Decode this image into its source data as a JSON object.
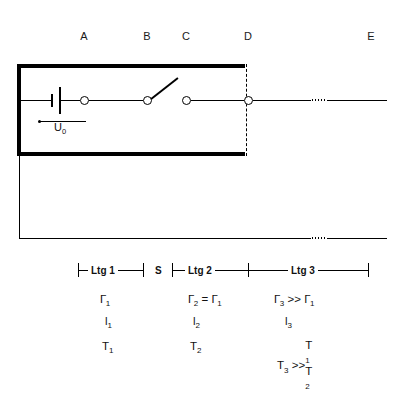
{
  "diagram": {
    "node_labels": [
      {
        "id": "A",
        "text": "A",
        "x": 84
      },
      {
        "id": "B",
        "text": "B",
        "x": 147
      },
      {
        "id": "C",
        "text": "C",
        "x": 186
      },
      {
        "id": "D",
        "text": "D",
        "x": 248
      },
      {
        "id": "E",
        "text": "E",
        "x": 371
      }
    ],
    "source": {
      "label": "U",
      "subscript": "0",
      "symbol": "battery-cell"
    },
    "switch": {
      "name": "S",
      "state": "open"
    },
    "dimensions": [
      {
        "id": "ltg1",
        "label": "Ltg 1",
        "start": 78,
        "end": 143
      },
      {
        "id": "s",
        "label": "S",
        "start": 143,
        "end": 172,
        "no_line": true
      },
      {
        "id": "ltg2",
        "label": "Ltg 2",
        "start": 172,
        "end": 248
      },
      {
        "id": "ltg3",
        "label": "Ltg 3",
        "start": 248,
        "end": 368
      }
    ],
    "parameter_rows": [
      {
        "id": "impedance",
        "symbol": "Gamma",
        "cells": [
          {
            "text": "Γ",
            "sub": "1",
            "x": 104
          },
          {
            "text": "Γ",
            "sub": "2",
            "rel": "=",
            "text2": "Γ",
            "sub2": "1",
            "x": 192
          },
          {
            "text": "Γ",
            "sub": "3",
            "rel": ">>",
            "text2": "Γ",
            "sub2": "1",
            "x": 278
          }
        ]
      },
      {
        "id": "length",
        "symbol": "l",
        "cells": [
          {
            "text": "l",
            "sub": "1",
            "x": 108
          },
          {
            "text": "l",
            "sub": "2",
            "x": 196
          },
          {
            "text": "l",
            "sub": "3",
            "x": 288
          }
        ]
      },
      {
        "id": "transit-time",
        "symbol": "T",
        "cells": [
          {
            "text": "T",
            "sub": "1",
            "x": 105
          },
          {
            "text": "T",
            "sub": "2",
            "x": 193
          },
          {
            "text": "T",
            "sub": "3",
            "rel": ">>",
            "stacked": [
              "T1",
              "T2"
            ],
            "x": 280
          }
        ]
      }
    ],
    "row_texts": {
      "gamma1": "Γ",
      "gamma1_sub": "1",
      "gamma2": "Γ",
      "gamma2_sub": "2",
      "gamma_eq": "=",
      "gamma2_rhs": "Γ",
      "gamma2_rhs_sub": "1",
      "gamma3": "Γ",
      "gamma3_sub": "3",
      "gamma_gg": ">>",
      "gamma3_rhs": "Γ",
      "gamma3_rhs_sub": "1",
      "l1": "l",
      "l1_sub": "1",
      "l2": "l",
      "l2_sub": "2",
      "l3": "l",
      "l3_sub": "3",
      "T1": "T",
      "T1_sub": "1",
      "T2": "T",
      "T2_sub": "2",
      "T3": "T",
      "T3_sub": "3",
      "T_gg": ">>",
      "T_stack_top": "T",
      "T_stack_top_sub": "1",
      "T_stack_bot": "T",
      "T_stack_bot_sub": "2"
    },
    "colors": {
      "ink": "#000000",
      "background": "#ffffff",
      "label": "#1a1a1a"
    }
  }
}
